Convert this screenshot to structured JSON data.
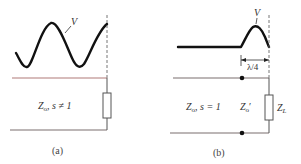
{
  "panels": [
    {
      "id": "a",
      "caption": "(a)",
      "wave_label": "V",
      "line_label_z": "Z",
      "line_label_sub": "o",
      "line_label_rest": ", s ≠ 1"
    },
    {
      "id": "b",
      "caption": "(b)",
      "wave_label": "V",
      "dimension_label": "λ/4",
      "line_label_z": "Z",
      "line_label_sub": "o",
      "line_label_rest": ", s = 1",
      "transformer_label_z": "Z",
      "transformer_label_sub": "o",
      "transformer_label_prime": "′",
      "load_label_z": "Z",
      "load_label_sub": "L"
    }
  ],
  "colors": {
    "wave": "#111111",
    "line_top": "#b07a78",
    "line_bottom": "#7a6e6e",
    "component": "#555555",
    "dashed": "#666666",
    "dot": "#111111"
  }
}
